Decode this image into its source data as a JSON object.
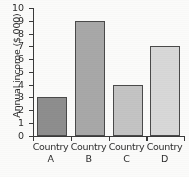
{
  "chart_data": {
    "type": "bar",
    "title": "",
    "xlabel": "",
    "ylabel": "Annual income ($ 000)",
    "categories": [
      "Country A",
      "Country B",
      "Country C",
      "Country D"
    ],
    "category_lines": [
      {
        "line1": "Country",
        "line2": "A"
      },
      {
        "line1": "Country",
        "line2": "B"
      },
      {
        "line1": "Country",
        "line2": "C"
      },
      {
        "line1": "Country",
        "line2": "D"
      }
    ],
    "values": [
      3,
      9,
      4,
      7
    ],
    "ylim": [
      0,
      10
    ],
    "ytick_labels": [
      "10",
      "9",
      "8",
      "7",
      "6",
      "5",
      "4",
      "3",
      "2",
      "1",
      "0"
    ],
    "ytick_values": [
      10,
      9,
      8,
      7,
      6,
      5,
      4,
      3,
      2,
      1,
      0
    ],
    "grid": false,
    "legend": false,
    "legend_position": "none",
    "bar_colors": [
      "#8e8e8e",
      "#a8a8a8",
      "#c4c4c4",
      "#d8d8d8"
    ],
    "bar_edge_color": "#4a4a4a",
    "axis_color": "#3a3a3a",
    "text_color": "#2e2e2e",
    "background_color": "#fbfbfa"
  }
}
